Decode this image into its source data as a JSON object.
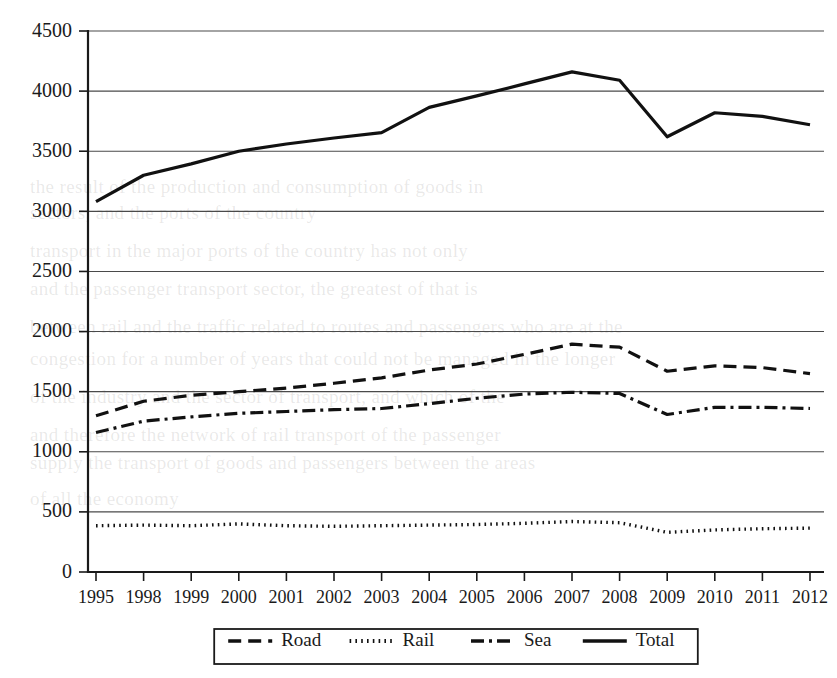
{
  "chart_data": {
    "type": "line",
    "title": "",
    "xlabel": "",
    "ylabel": "",
    "ylim": [
      0,
      4500
    ],
    "ytick_step": 500,
    "yticks": [
      0,
      500,
      1000,
      1500,
      2000,
      2500,
      3000,
      3500,
      4000,
      4500
    ],
    "grid": true,
    "legend_position": "bottom",
    "categories": [
      "1995",
      "1998",
      "1999",
      "2000",
      "2001",
      "2002",
      "2003",
      "2004",
      "2005",
      "2006",
      "2007",
      "2008",
      "2009",
      "2010",
      "2011",
      "2012"
    ],
    "series": [
      {
        "name": "Road",
        "style": "dashed",
        "values": [
          1300,
          1420,
          1470,
          1500,
          1530,
          1570,
          1615,
          1680,
          1730,
          1810,
          1895,
          1870,
          1670,
          1715,
          1700,
          1650
        ]
      },
      {
        "name": "Rail",
        "style": "dotted",
        "values": [
          385,
          390,
          385,
          400,
          385,
          380,
          385,
          390,
          395,
          405,
          420,
          410,
          330,
          350,
          360,
          365
        ]
      },
      {
        "name": "Sea",
        "style": "dash-dot",
        "values": [
          1160,
          1255,
          1290,
          1320,
          1335,
          1350,
          1360,
          1400,
          1445,
          1480,
          1495,
          1485,
          1310,
          1370,
          1370,
          1360
        ]
      },
      {
        "name": "Total",
        "style": "solid",
        "values": [
          3080,
          3300,
          3395,
          3500,
          3560,
          3610,
          3655,
          3865,
          3960,
          4060,
          4160,
          4090,
          3620,
          3820,
          3790,
          3720
        ]
      }
    ],
    "legend": [
      {
        "label": "Road",
        "style": "dashed"
      },
      {
        "label": "Rail",
        "style": "dotted"
      },
      {
        "label": "Sea",
        "style": "dash-dot"
      },
      {
        "label": "Total",
        "style": "solid"
      }
    ],
    "colors": {
      "ink": "#111111",
      "grid": "#4a4a4a",
      "background": "#ffffff"
    }
  },
  "background_text": {
    "lines": [
      "the result of the production and consumption of goods in",
      "sectors, and the ports of the country",
      "transport in the major ports of the country has not only",
      "and the passenger transport sector, the greatest of that is",
      "between rail and the traffic related to routes and passengers who are at the",
      "congestion for a number of years that could not be managed in the longer",
      "of the industry and the sector of transport, and which of the",
      "and therefore the network of rail transport of the passenger",
      "supply the transport of goods and passengers between the areas",
      "of all the economy"
    ]
  }
}
